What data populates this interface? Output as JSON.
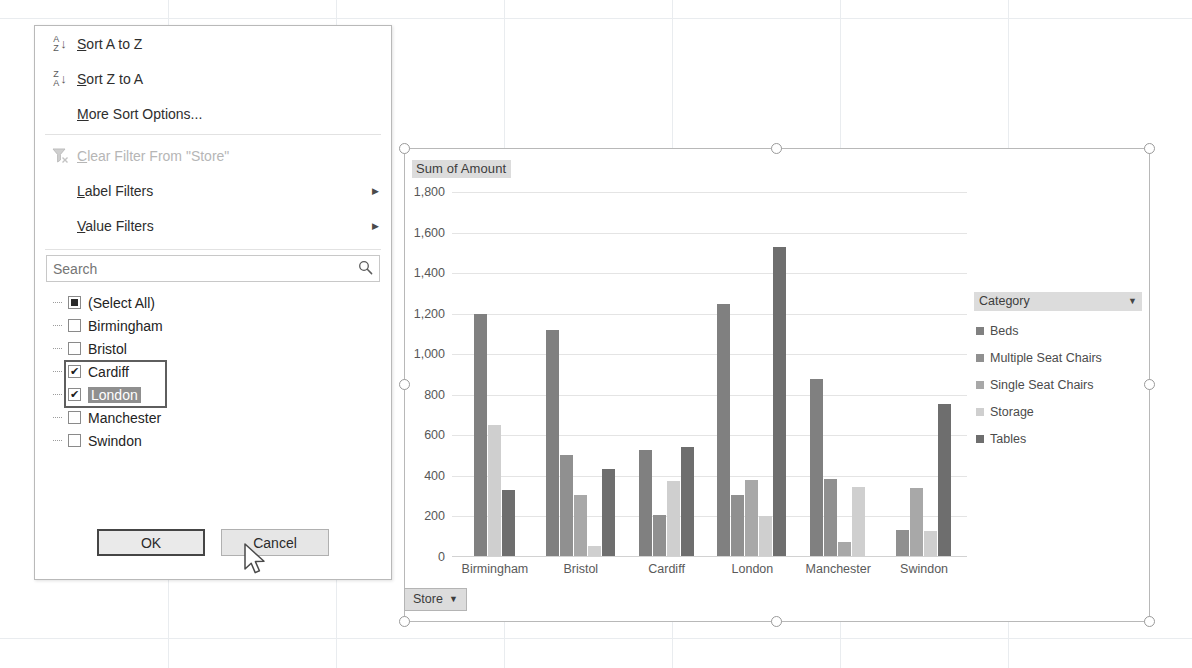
{
  "app": {
    "name": "excel-pivotchart-filter"
  },
  "chart": {
    "title": "Sum of Amount",
    "field_button": {
      "label": "Store",
      "caret": "▼"
    },
    "legend": {
      "title": "Category",
      "caret": "▼"
    },
    "selection_handles": 8
  },
  "chart_data": {
    "type": "bar",
    "title": "Sum of Amount",
    "xlabel": "Store",
    "ylabel": "",
    "ylim": [
      0,
      1800
    ],
    "yticks": [
      "0",
      "200",
      "400",
      "600",
      "800",
      "1,000",
      "1,200",
      "1,400",
      "1,600",
      "1,800"
    ],
    "grid": true,
    "legend_position": "right",
    "legend_title": "Category",
    "categories": [
      "Birmingham",
      "Bristol",
      "Cardiff",
      "London",
      "Manchester",
      "Swindon"
    ],
    "series": [
      {
        "name": "Beds",
        "color": "#808080",
        "values": [
          1200,
          1120,
          530,
          1250,
          880,
          null
        ]
      },
      {
        "name": "Multiple Seat Chairs",
        "color": "#909090",
        "values": [
          null,
          505,
          205,
          305,
          385,
          135
        ]
      },
      {
        "name": "Single Seat Chairs",
        "color": "#a8a8a8",
        "values": [
          null,
          305,
          null,
          380,
          75,
          340
        ]
      },
      {
        "name": "Storage",
        "color": "#cfcfcf",
        "values": [
          650,
          55,
          375,
          200,
          345,
          130
        ]
      },
      {
        "name": "Tables",
        "color": "#6e6e6e",
        "values": [
          330,
          435,
          545,
          1530,
          null,
          400
        ]
      }
    ],
    "extra_bar_swindon_tables": 755
  },
  "filter_menu": {
    "items": [
      {
        "id": "sort-a-to-z",
        "label": "Sort A to Z",
        "icon": "sort-ascending-icon",
        "disabled": false,
        "submenu": false
      },
      {
        "id": "sort-z-to-a",
        "label": "Sort Z to A",
        "icon": "sort-descending-icon",
        "disabled": false,
        "submenu": false
      },
      {
        "id": "more-sort-options",
        "label": "More Sort Options...",
        "icon": "",
        "disabled": false,
        "submenu": false
      },
      {
        "id": "clear-filter",
        "label": "Clear Filter From \"Store\"",
        "icon": "clear-filter-icon",
        "disabled": true,
        "submenu": false
      },
      {
        "id": "label-filters",
        "label": "Label Filters",
        "icon": "",
        "disabled": false,
        "submenu": true
      },
      {
        "id": "value-filters",
        "label": "Value Filters",
        "icon": "",
        "disabled": false,
        "submenu": true
      }
    ],
    "submenu_arrow": "▶",
    "search": {
      "placeholder": "Search",
      "value": "",
      "icon": "search-icon"
    },
    "checkbox_list": [
      {
        "label": "(Select All)",
        "state": "partial",
        "selected": false
      },
      {
        "label": "Birmingham",
        "state": "unchecked",
        "selected": false
      },
      {
        "label": "Bristol",
        "state": "unchecked",
        "selected": false
      },
      {
        "label": "Cardiff",
        "state": "checked",
        "selected": false
      },
      {
        "label": "London",
        "state": "checked",
        "selected": true
      },
      {
        "label": "Manchester",
        "state": "unchecked",
        "selected": false
      },
      {
        "label": "Swindon",
        "state": "unchecked",
        "selected": false
      }
    ],
    "buttons": {
      "ok": "OK",
      "cancel": "Cancel"
    }
  }
}
